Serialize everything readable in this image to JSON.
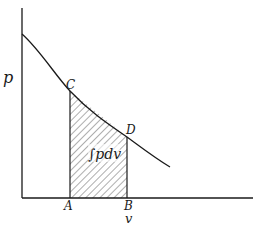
{
  "diagram": {
    "type": "pressure-volume work diagram",
    "axes": {
      "y_label": "p",
      "x_label": "v"
    },
    "points": {
      "C": "C",
      "D": "D",
      "A": "A",
      "B": "B"
    },
    "area_label": "∫pdv",
    "colors": {
      "ink": "#1a1a1a",
      "background": "#ffffff"
    }
  }
}
